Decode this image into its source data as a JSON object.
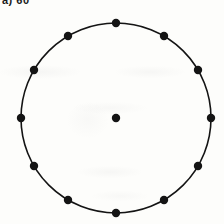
{
  "figure": {
    "caption_label": "a) 60",
    "background_color": "#fdfdfb",
    "ink_color": "#141414"
  },
  "chart_data": {
    "type": "scatter",
    "title": "a) 60",
    "xlabel": "",
    "ylabel": "",
    "xlim": [
      0,
      224
    ],
    "ylim": [
      224,
      0
    ],
    "grid": false,
    "legend": null,
    "circle": {
      "center_x": 116,
      "center_y": 118,
      "radius": 95,
      "stroke_width": 1.6,
      "stroke_color": "#141414",
      "fill": "none"
    },
    "marker_radius": 4.2,
    "marker_color": "#141414",
    "point_count_on_circumference": 12,
    "angular_spacing_degrees": 30,
    "series": [
      {
        "name": "circumference-points",
        "points": [
          {
            "label": "12",
            "angle_deg": 90,
            "x": 116,
            "y": 23
          },
          {
            "label": "1",
            "angle_deg": 60,
            "x": 164,
            "y": 36
          },
          {
            "label": "2",
            "angle_deg": 30,
            "x": 198,
            "y": 70
          },
          {
            "label": "3",
            "angle_deg": 0,
            "x": 211,
            "y": 118
          },
          {
            "label": "4",
            "angle_deg": 330,
            "x": 198,
            "y": 166
          },
          {
            "label": "5",
            "angle_deg": 300,
            "x": 164,
            "y": 200
          },
          {
            "label": "6",
            "angle_deg": 270,
            "x": 116,
            "y": 213
          },
          {
            "label": "7",
            "angle_deg": 240,
            "x": 68,
            "y": 200
          },
          {
            "label": "8",
            "angle_deg": 210,
            "x": 34,
            "y": 166
          },
          {
            "label": "9",
            "angle_deg": 180,
            "x": 21,
            "y": 118
          },
          {
            "label": "10",
            "angle_deg": 150,
            "x": 34,
            "y": 70
          },
          {
            "label": "11",
            "angle_deg": 120,
            "x": 68,
            "y": 36
          }
        ]
      },
      {
        "name": "centre-point",
        "points": [
          {
            "label": "centre",
            "x": 116,
            "y": 118
          }
        ]
      }
    ]
  }
}
